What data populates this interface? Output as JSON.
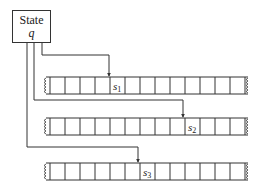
{
  "state": {
    "title": "State",
    "variable": "q"
  },
  "tapes": [
    {
      "head_label": "s",
      "head_sub": "1",
      "head_cell": 4,
      "y": 77
    },
    {
      "head_label": "s",
      "head_sub": "2",
      "head_cell": 9,
      "y": 118
    },
    {
      "head_label": "s",
      "head_sub": "3",
      "head_cell": 6,
      "y": 163
    }
  ],
  "colors": {
    "line": "#333333",
    "background": "#ffffff"
  }
}
